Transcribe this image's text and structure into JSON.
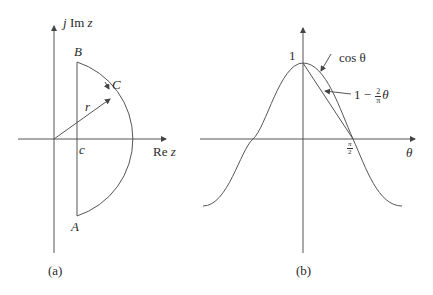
{
  "panel_a": {
    "caption": "(a)",
    "y_axis_label_j": "j",
    "y_axis_label_im": "Im",
    "y_axis_label_z": "z",
    "x_axis_label_re": "Re",
    "x_axis_label_z": "z",
    "point_b": "B",
    "point_c": "C",
    "point_a": "A",
    "radius_label": "r",
    "intercept_label": "c"
  },
  "panel_b": {
    "caption": "(b)",
    "peak_label": "1",
    "x_axis_label": "θ",
    "tick_num": "π",
    "tick_den": "2",
    "curve1_label": "cos θ",
    "curve2_prefix": "1 −",
    "curve2_frac_num": "2",
    "curve2_frac_den": "π",
    "curve2_suffix": "θ"
  },
  "colors": {
    "stroke": "#555555",
    "text": "#2a2a2a"
  }
}
